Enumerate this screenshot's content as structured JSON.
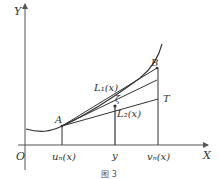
{
  "figure": {
    "caption": "图 3",
    "colors": {
      "line": "#333333",
      "axis": "#555555",
      "background": "#ffffff"
    },
    "axes": {
      "x_label": "X",
      "y_label": "Y",
      "origin_label": "O"
    },
    "points": {
      "A": "A",
      "B": "B",
      "T": "T",
      "zeta": "ζ"
    },
    "lines": {
      "L1": "L₁(x)",
      "L2": "L₂(x)"
    },
    "x_ticks": {
      "u": "uₙ(x)",
      "y": "y",
      "v": "vₙ(x)"
    }
  }
}
